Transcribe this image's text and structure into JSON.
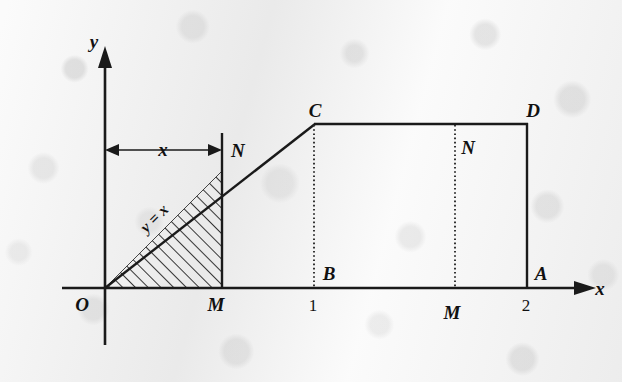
{
  "figure": {
    "kind": "coordinate-geometry-diagram",
    "axes": {
      "x_axis_label": "x",
      "y_axis_label": "y",
      "origin_label": "O"
    },
    "tick_labels": [
      {
        "id": "tick-one",
        "text": "1"
      },
      {
        "id": "tick-two",
        "text": "2"
      }
    ],
    "point_labels": [
      {
        "id": "label-N-left",
        "text": "N"
      },
      {
        "id": "label-M-left",
        "text": "M"
      },
      {
        "id": "label-C",
        "text": "C"
      },
      {
        "id": "label-D",
        "text": "D"
      },
      {
        "id": "label-B",
        "text": "B"
      },
      {
        "id": "label-A",
        "text": "A"
      },
      {
        "id": "label-N-right",
        "text": "N"
      },
      {
        "id": "label-M-right",
        "text": "M"
      }
    ],
    "annotations": {
      "dimension_label": "x",
      "curve_label": "y = x"
    },
    "colors": {
      "ink": "#1a1a1a",
      "paper": "#f0f0f0",
      "hatch": "#141414"
    }
  }
}
